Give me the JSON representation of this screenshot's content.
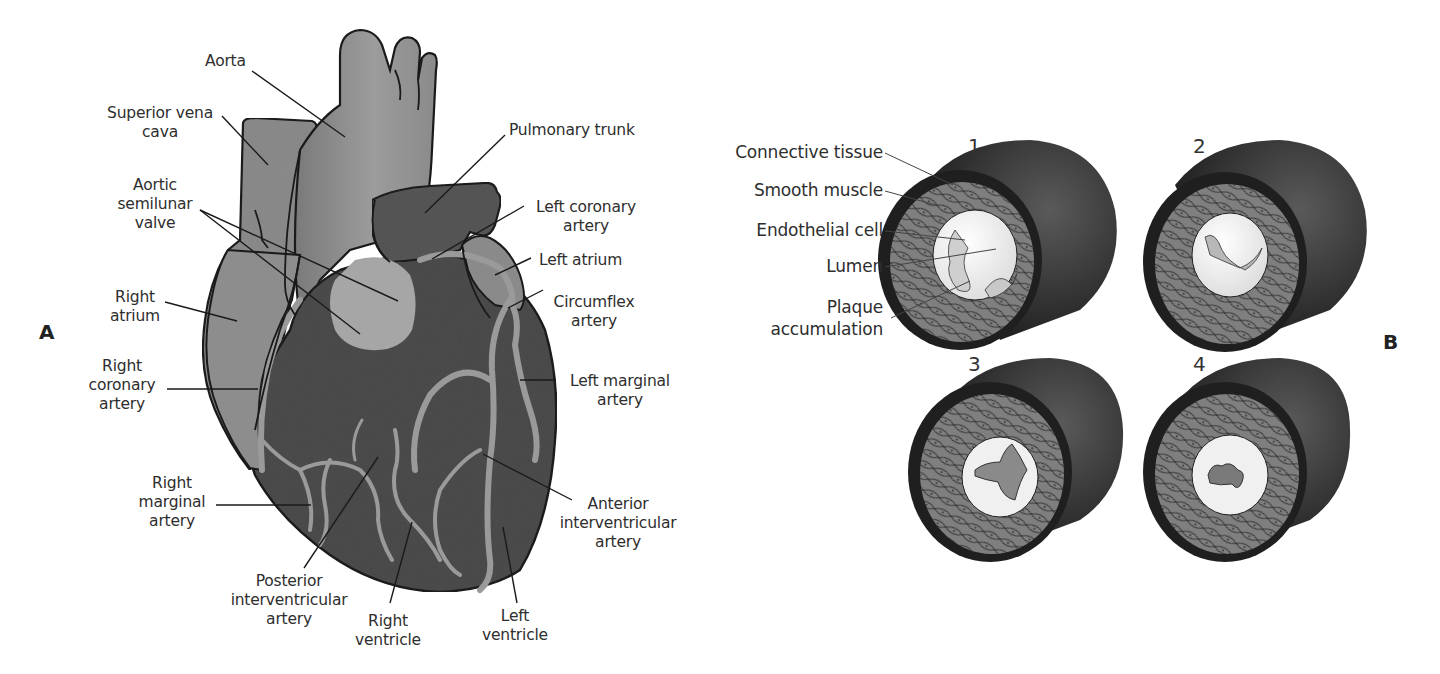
{
  "figure": {
    "panels": [
      {
        "id": "A",
        "marker": "A",
        "subject": "Anterior view of the heart and coronary arteries",
        "labels": {
          "aorta": "Aorta",
          "superior_vena_cava": [
            "Superior vena",
            "cava"
          ],
          "aortic_semilunar_valve": [
            "Aortic",
            "semilunar",
            "valve"
          ],
          "right_atrium": [
            "Right",
            "atrium"
          ],
          "right_coronary_artery": [
            "Right",
            "coronary",
            "artery"
          ],
          "right_marginal_artery": [
            "Right",
            "marginal",
            "artery"
          ],
          "posterior_interventricular_artery": [
            "Posterior",
            "interventricular",
            "artery"
          ],
          "right_ventricle": [
            "Right",
            "ventricle"
          ],
          "left_ventricle": [
            "Left",
            "ventricle"
          ],
          "anterior_interventricular_artery": [
            "Anterior",
            "interventricular",
            "artery"
          ],
          "left_marginal_artery": [
            "Left marginal",
            "artery"
          ],
          "circumflex_artery": [
            "Circumflex",
            "artery"
          ],
          "left_atrium": "Left atrium",
          "left_coronary_artery": [
            "Left coronary",
            "artery"
          ],
          "pulmonary_trunk": "Pulmonary trunk"
        }
      },
      {
        "id": "B",
        "marker": "B",
        "subject": "Progression of plaque accumulation in a coronary artery",
        "labels": {
          "connective_tissue": "Connective tissue",
          "smooth_muscle": "Smooth muscle",
          "endothelial_cell": "Endothelial cell",
          "lumen": "Lumen",
          "plaque_accumulation": [
            "Plaque",
            "accumulation"
          ]
        },
        "stages": [
          {
            "number": "1"
          },
          {
            "number": "2"
          },
          {
            "number": "3"
          },
          {
            "number": "4"
          }
        ]
      }
    ],
    "colors": {
      "background": "#ffffff",
      "outline": "#1a1a1a",
      "aorta_gray": "#8c8c8c",
      "vena_cava_gray": "#8a8a8a",
      "ventricle_dark": "#4a4a4a",
      "pulmonary_dark": "#555555",
      "artery_light": "#9a9a9a",
      "valve_light": "#a8a8a8",
      "vessel_outer": "#2b2b2b",
      "muscle_layer": "#7d7d7d",
      "lumen_white": "#f3f3f3",
      "label_text": "#2e2e2e"
    }
  }
}
